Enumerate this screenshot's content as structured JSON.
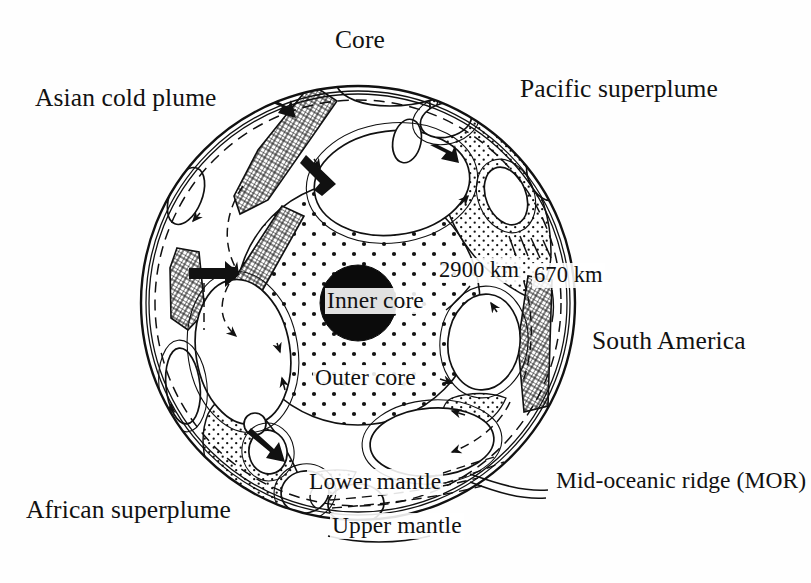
{
  "figure": {
    "type": "geological-cross-section-diagram",
    "background_color": "#ffffff",
    "ink_color": "#111111"
  },
  "labels": {
    "core": "Core",
    "asian_cold_plume": "Asian cold plume",
    "pacific_superplume": "Pacific superplume",
    "depth_2900": "2900 km",
    "depth_670": "670 km",
    "south_america": "South America",
    "inner_core": "Inner core",
    "outer_core": "Outer core",
    "lower_mantle": "Lower mantle",
    "upper_mantle": "Upper mantle",
    "mid_oceanic_ridge": "Mid-oceanic ridge (MOR)",
    "african_superplume": "African superplume"
  },
  "geometry": {
    "globe_center_x": 358,
    "globe_center_y": 303,
    "globe_radius": 217,
    "mantle_670_radius": 203,
    "core_radius": 122,
    "inner_core_radius": 38
  },
  "layers": [
    {
      "name": "Upper mantle",
      "boundary_depth_km": 670,
      "fill": "white"
    },
    {
      "name": "Lower mantle",
      "boundary_depth_km": 2900,
      "fill": "white"
    },
    {
      "name": "Outer core",
      "fill": "coarse-stipple"
    },
    {
      "name": "Inner core",
      "fill": "solid-black"
    }
  ],
  "features": [
    {
      "name": "Asian cold plume",
      "pattern": "crosshatch",
      "meaning": "subducted cold slab material"
    },
    {
      "name": "Pacific superplume",
      "pattern": "fine-stipple",
      "meaning": "hot upwelling"
    },
    {
      "name": "African superplume",
      "pattern": "fine-stipple",
      "meaning": "hot upwelling"
    },
    {
      "name": "South America",
      "pattern": "crosshatch",
      "meaning": "subducting slab"
    },
    {
      "name": "Mid-oceanic ridge (MOR)",
      "pattern": "dashed-line",
      "meaning": "spreading centre"
    }
  ],
  "arrows": {
    "solid_count": 5,
    "meaning": "direction of mantle flow / slab descent",
    "dashed_meaning": "inferred return flow paths"
  }
}
